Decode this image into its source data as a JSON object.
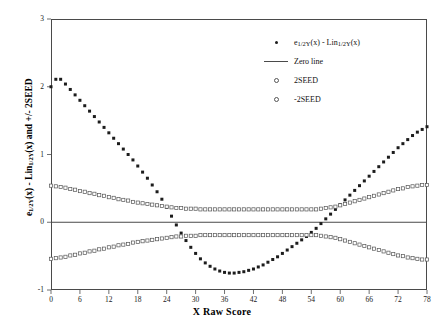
{
  "chart_data": {
    "type": "scatter",
    "title": "",
    "xlabel": "X Raw Score",
    "ylabel": "e1/2Y(x) - Lin1/2Y(x) and +/- 2SEED",
    "xlim": [
      0,
      78
    ],
    "ylim": [
      -1,
      3
    ],
    "xticks": [
      0,
      6,
      12,
      18,
      24,
      30,
      36,
      42,
      48,
      54,
      60,
      66,
      72,
      78
    ],
    "yticks": [
      -1,
      0,
      1,
      2,
      3
    ],
    "grid": false,
    "legend_position": "top-right",
    "legend": [
      {
        "label_prefix": "e",
        "label_sub1": "1/2Y",
        "label_mid": "(x) - Lin",
        "label_sub2": "1/2Y",
        "label_suffix": "(x)",
        "marker": "filled-dot"
      },
      {
        "label_prefix": "Zero line",
        "marker": "line"
      },
      {
        "label_prefix": "2SEED",
        "marker": "open-dot"
      },
      {
        "label_prefix": "-2SEED",
        "marker": "open-dot"
      }
    ],
    "series": [
      {
        "name": "e1/2Y(x) - Lin1/2Y(x)",
        "marker": "filled-dot",
        "color": "#1c1c1c",
        "x": [
          0,
          1,
          2,
          3,
          4,
          5,
          6,
          7,
          8,
          9,
          10,
          11,
          12,
          13,
          14,
          15,
          16,
          17,
          18,
          19,
          20,
          21,
          22,
          23,
          24,
          25,
          26,
          27,
          28,
          29,
          30,
          31,
          32,
          33,
          34,
          35,
          36,
          37,
          38,
          39,
          40,
          41,
          42,
          43,
          44,
          45,
          46,
          47,
          48,
          49,
          50,
          51,
          52,
          53,
          54,
          55,
          56,
          57,
          58,
          59,
          60,
          61,
          62,
          63,
          64,
          65,
          66,
          67,
          68,
          69,
          70,
          71,
          72,
          73,
          74,
          75,
          76,
          77,
          78
        ],
        "y": [
          2.0,
          2.11,
          2.11,
          2.04,
          1.96,
          1.88,
          1.8,
          1.72,
          1.64,
          1.56,
          1.48,
          1.4,
          1.32,
          1.24,
          1.16,
          1.08,
          1.0,
          0.92,
          0.83,
          0.74,
          0.65,
          0.55,
          0.45,
          0.34,
          0.22,
          0.09,
          -0.04,
          -0.16,
          -0.27,
          -0.37,
          -0.46,
          -0.54,
          -0.6,
          -0.65,
          -0.69,
          -0.72,
          -0.74,
          -0.75,
          -0.75,
          -0.74,
          -0.73,
          -0.71,
          -0.69,
          -0.66,
          -0.63,
          -0.59,
          -0.55,
          -0.51,
          -0.46,
          -0.41,
          -0.36,
          -0.31,
          -0.26,
          -0.21,
          -0.15,
          -0.09,
          -0.02,
          0.05,
          0.12,
          0.19,
          0.26,
          0.33,
          0.4,
          0.47,
          0.54,
          0.61,
          0.68,
          0.75,
          0.82,
          0.89,
          0.96,
          1.03,
          1.1,
          1.16,
          1.22,
          1.28,
          1.33,
          1.37,
          1.41
        ]
      },
      {
        "name": "2SEED",
        "marker": "open-dot",
        "color": "#555555",
        "x": [
          0,
          1,
          2,
          3,
          4,
          5,
          6,
          7,
          8,
          9,
          10,
          11,
          12,
          13,
          14,
          15,
          16,
          17,
          18,
          19,
          20,
          21,
          22,
          23,
          24,
          25,
          26,
          27,
          28,
          29,
          30,
          31,
          32,
          33,
          34,
          35,
          36,
          37,
          38,
          39,
          40,
          41,
          42,
          43,
          44,
          45,
          46,
          47,
          48,
          49,
          50,
          51,
          52,
          53,
          54,
          55,
          56,
          57,
          58,
          59,
          60,
          61,
          62,
          63,
          64,
          65,
          66,
          67,
          68,
          69,
          70,
          71,
          72,
          73,
          74,
          75,
          76,
          77,
          78
        ],
        "y": [
          0.54,
          0.53,
          0.52,
          0.51,
          0.49,
          0.48,
          0.46,
          0.45,
          0.43,
          0.42,
          0.4,
          0.39,
          0.37,
          0.36,
          0.34,
          0.33,
          0.32,
          0.3,
          0.29,
          0.28,
          0.27,
          0.26,
          0.25,
          0.24,
          0.23,
          0.22,
          0.21,
          0.21,
          0.2,
          0.2,
          0.2,
          0.19,
          0.19,
          0.19,
          0.19,
          0.19,
          0.19,
          0.19,
          0.19,
          0.19,
          0.19,
          0.19,
          0.19,
          0.19,
          0.19,
          0.19,
          0.19,
          0.19,
          0.19,
          0.19,
          0.19,
          0.19,
          0.19,
          0.19,
          0.19,
          0.19,
          0.2,
          0.21,
          0.22,
          0.23,
          0.25,
          0.27,
          0.29,
          0.31,
          0.33,
          0.35,
          0.37,
          0.39,
          0.41,
          0.43,
          0.45,
          0.47,
          0.49,
          0.5,
          0.52,
          0.53,
          0.54,
          0.55,
          0.55
        ]
      },
      {
        "name": "-2SEED",
        "marker": "open-dot",
        "color": "#555555",
        "x": [
          0,
          1,
          2,
          3,
          4,
          5,
          6,
          7,
          8,
          9,
          10,
          11,
          12,
          13,
          14,
          15,
          16,
          17,
          18,
          19,
          20,
          21,
          22,
          23,
          24,
          25,
          26,
          27,
          28,
          29,
          30,
          31,
          32,
          33,
          34,
          35,
          36,
          37,
          38,
          39,
          40,
          41,
          42,
          43,
          44,
          45,
          46,
          47,
          48,
          49,
          50,
          51,
          52,
          53,
          54,
          55,
          56,
          57,
          58,
          59,
          60,
          61,
          62,
          63,
          64,
          65,
          66,
          67,
          68,
          69,
          70,
          71,
          72,
          73,
          74,
          75,
          76,
          77,
          78
        ],
        "y": [
          -0.54,
          -0.53,
          -0.52,
          -0.51,
          -0.49,
          -0.48,
          -0.46,
          -0.45,
          -0.43,
          -0.42,
          -0.4,
          -0.39,
          -0.37,
          -0.36,
          -0.34,
          -0.33,
          -0.32,
          -0.3,
          -0.29,
          -0.28,
          -0.27,
          -0.26,
          -0.25,
          -0.24,
          -0.23,
          -0.22,
          -0.21,
          -0.21,
          -0.2,
          -0.2,
          -0.2,
          -0.19,
          -0.19,
          -0.19,
          -0.19,
          -0.19,
          -0.19,
          -0.19,
          -0.19,
          -0.19,
          -0.19,
          -0.19,
          -0.19,
          -0.19,
          -0.19,
          -0.19,
          -0.19,
          -0.19,
          -0.19,
          -0.19,
          -0.19,
          -0.19,
          -0.19,
          -0.19,
          -0.19,
          -0.19,
          -0.2,
          -0.21,
          -0.22,
          -0.23,
          -0.25,
          -0.27,
          -0.29,
          -0.31,
          -0.33,
          -0.35,
          -0.37,
          -0.39,
          -0.41,
          -0.43,
          -0.45,
          -0.47,
          -0.49,
          -0.5,
          -0.52,
          -0.53,
          -0.54,
          -0.55,
          -0.55
        ]
      }
    ],
    "zero_line": {
      "name": "Zero line",
      "value": 0,
      "color": "#4a4a4a"
    },
    "colors": {
      "axis": "#4a4a4a",
      "points_main": "#1c1c1c",
      "points_band": "#555555",
      "text": "#000000"
    }
  },
  "axis": {
    "ylabel_part1": "e",
    "ylabel_sub1": "1/2Y",
    "ylabel_part2": "(x) - Lin",
    "ylabel_sub2": "1/2Y",
    "ylabel_part3": "(x) and +/- 2SEED",
    "xlabel": "X Raw Score"
  }
}
